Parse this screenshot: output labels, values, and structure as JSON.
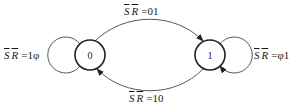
{
  "diagram": {
    "type": "state-transition",
    "states": [
      {
        "id": "s0",
        "label": "0"
      },
      {
        "id": "s1",
        "label": "1"
      }
    ],
    "transitions": [
      {
        "from": "0",
        "to": "1",
        "vars": [
          "S",
          "R"
        ],
        "value": "01",
        "position": "top"
      },
      {
        "from": "1",
        "to": "0",
        "vars": [
          "S",
          "R"
        ],
        "value": "10",
        "position": "bottom"
      },
      {
        "from": "0",
        "to": "0",
        "vars": [
          "S",
          "R"
        ],
        "value": "1φ",
        "position": "left"
      },
      {
        "from": "1",
        "to": "1",
        "vars": [
          "S",
          "R"
        ],
        "value": "φ1",
        "position": "right"
      }
    ],
    "labels": {
      "top": {
        "s": "S",
        "r": "R",
        "eq": "=01"
      },
      "bottom": {
        "s": "S",
        "r": "R",
        "eq": "=10"
      },
      "left": {
        "s": "S",
        "r": "R",
        "eq": "=1φ"
      },
      "right": {
        "s": "S",
        "r": "R",
        "eq": "=φ1"
      }
    },
    "colors": {
      "stroke": "#333333",
      "background": "#ffffff"
    }
  }
}
